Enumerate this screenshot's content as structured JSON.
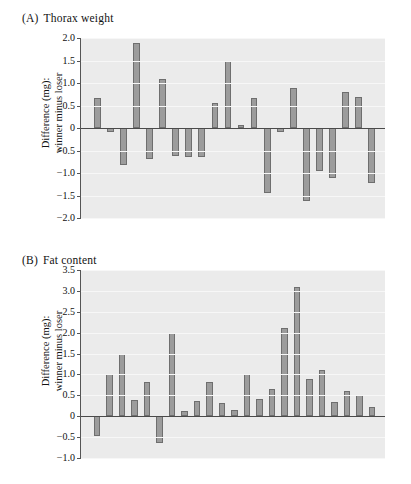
{
  "figure": {
    "background_color": "#ffffff",
    "bar_color": "#9c9c9c",
    "bar_edge_color": "#6e6e6e",
    "plot_background_color": "#ebebeb",
    "axis_color": "#555555"
  },
  "panels": [
    {
      "tag": "(A)",
      "title": "Thorax weight",
      "ylabel_line1": "Difference (mg):",
      "ylabel_line2": "winner minus loser"
    },
    {
      "tag": "(B)",
      "title": "Fat content",
      "ylabel_line1": "Difference (mg):",
      "ylabel_line2": "winner minus loser"
    }
  ],
  "chart_data": [
    {
      "type": "bar",
      "title": "(A) Thorax weight",
      "xlabel": "",
      "ylabel": "Difference (mg): winner minus loser",
      "ylim": [
        -2.0,
        2.0
      ],
      "yticks": [
        2.0,
        1.5,
        1.0,
        0.5,
        0,
        -0.5,
        -1.0,
        -1.5,
        -2.0
      ],
      "ytick_labels": [
        "2.0",
        "1.5",
        "1.0",
        "0.5",
        "0",
        "-0.5",
        "-1.0",
        "-1.5",
        "-2.0"
      ],
      "grid": true,
      "legend": "none",
      "categories": [
        "1",
        "2",
        "3",
        "4",
        "5",
        "6",
        "7",
        "8",
        "9",
        "10",
        "11",
        "12",
        "13",
        "14",
        "15",
        "16",
        "17",
        "18",
        "19",
        "20",
        "21",
        "22"
      ],
      "values": [
        0.66,
        -0.09,
        -0.83,
        1.9,
        -0.69,
        1.1,
        -0.63,
        -0.64,
        -0.64,
        0.55,
        1.48,
        0.07,
        0.67,
        -1.45,
        -0.09,
        0.88,
        -1.62,
        -0.95,
        -1.12,
        0.79,
        0.69,
        -1.22
      ]
    },
    {
      "type": "bar",
      "title": "(B) Fat content",
      "xlabel": "",
      "ylabel": "Difference (mg): winner minus loser",
      "ylim": [
        -1.0,
        3.5
      ],
      "yticks": [
        3.5,
        3.0,
        2.5,
        2.0,
        1.5,
        1.0,
        0.5,
        0,
        -0.5,
        -1.0
      ],
      "ytick_labels": [
        "3.5",
        "3.0",
        "2.5",
        "2.0",
        "1.5",
        "1.0",
        "0.5",
        "0",
        "-0.5",
        "-1.0"
      ],
      "grid": true,
      "legend": "none",
      "categories": [
        "1",
        "2",
        "3",
        "4",
        "5",
        "6",
        "7",
        "8",
        "9",
        "10",
        "11",
        "12",
        "13",
        "14",
        "15",
        "16",
        "17",
        "18",
        "19",
        "20",
        "21",
        "22",
        "23"
      ],
      "values": [
        -0.47,
        1.0,
        1.48,
        0.4,
        0.81,
        -0.64,
        2.0,
        0.13,
        0.37,
        0.81,
        0.32,
        0.14,
        1.0,
        0.41,
        0.65,
        2.11,
        3.1,
        0.9,
        1.11,
        0.33,
        0.61,
        0.51,
        0.21
      ]
    }
  ]
}
